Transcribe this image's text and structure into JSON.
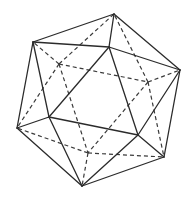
{
  "figure": {
    "style": "wireframe line drawing",
    "stroke_color": "#2b2b2b",
    "background": "#ffffff",
    "vertices": {
      "T": [
        114,
        14
      ],
      "UL": [
        33,
        42
      ],
      "R": [
        180,
        70
      ],
      "F1": [
        109,
        47
      ],
      "L": [
        17,
        128
      ],
      "F2": [
        49,
        117
      ],
      "F3": [
        138,
        135
      ],
      "BR": [
        164,
        157
      ],
      "B": [
        82,
        186
      ],
      "H1": [
        59,
        64
      ],
      "H2": [
        148,
        82
      ],
      "H3": [
        88,
        153
      ]
    },
    "visible_edges": [
      [
        "T",
        "UL"
      ],
      [
        "T",
        "R"
      ],
      [
        "T",
        "F1"
      ],
      [
        "UL",
        "F1"
      ],
      [
        "F1",
        "R"
      ],
      [
        "UL",
        "L"
      ],
      [
        "UL",
        "F2"
      ],
      [
        "F1",
        "F2"
      ],
      [
        "F1",
        "F3"
      ],
      [
        "R",
        "F3"
      ],
      [
        "R",
        "BR"
      ],
      [
        "L",
        "F2"
      ],
      [
        "L",
        "B"
      ],
      [
        "F2",
        "F3"
      ],
      [
        "F2",
        "B"
      ],
      [
        "F3",
        "B"
      ],
      [
        "F3",
        "BR"
      ],
      [
        "B",
        "BR"
      ]
    ],
    "hidden_edges": [
      [
        "H1",
        "UL"
      ],
      [
        "H1",
        "T"
      ],
      [
        "H1",
        "L"
      ],
      [
        "H1",
        "H2"
      ],
      [
        "H1",
        "H3"
      ],
      [
        "H2",
        "T"
      ],
      [
        "H2",
        "R"
      ],
      [
        "H2",
        "BR"
      ],
      [
        "H2",
        "H3"
      ],
      [
        "H3",
        "L"
      ],
      [
        "H3",
        "B"
      ],
      [
        "H3",
        "BR"
      ]
    ]
  }
}
